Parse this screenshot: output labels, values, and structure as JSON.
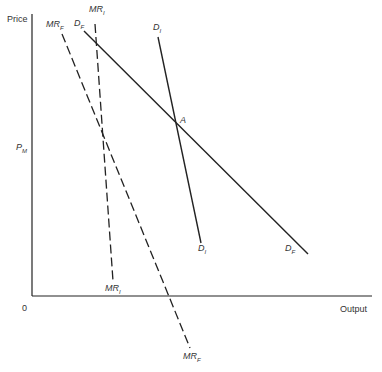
{
  "diagram": {
    "axes": {
      "y_label": "Price",
      "x_label": "Output",
      "origin_label": "0",
      "price_marker": {
        "main": "P",
        "sub": "M"
      }
    },
    "curves": [
      {
        "id": "DF",
        "main": "D",
        "sub": "F",
        "style": "solid"
      },
      {
        "id": "DI",
        "main": "D",
        "sub": "I",
        "style": "solid"
      },
      {
        "id": "MRF",
        "main": "MR",
        "sub": "F",
        "style": "dashed"
      },
      {
        "id": "MRI",
        "main": "MR",
        "sub": "I",
        "style": "dashed"
      }
    ],
    "labels": {
      "mri_top": {
        "main": "MR",
        "sub": "I"
      },
      "mrf_top": {
        "main": "MR",
        "sub": "F"
      },
      "df_top": {
        "main": "D",
        "sub": "F"
      },
      "di_top": {
        "main": "D",
        "sub": "I"
      },
      "di_bottom": {
        "main": "D",
        "sub": "I"
      },
      "df_bottom": {
        "main": "D",
        "sub": "F"
      },
      "mri_bottom": {
        "main": "MR",
        "sub": "I"
      },
      "mrf_bottom": {
        "main": "MR",
        "sub": "F"
      },
      "intersection": "A"
    },
    "colors": {
      "line": "#222222",
      "text": "#333333",
      "background": "#ffffff"
    }
  }
}
